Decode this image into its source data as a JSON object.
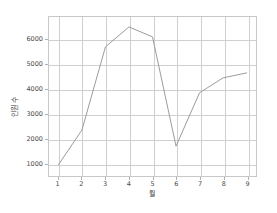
{
  "chart_data": {
    "type": "line",
    "title": "",
    "xlabel": "월",
    "ylabel": "인원 수",
    "x": [
      1,
      2,
      3,
      4,
      5,
      6,
      7,
      8,
      9
    ],
    "values": [
      950,
      2350,
      5700,
      6500,
      6100,
      1700,
      3850,
      4450,
      4650
    ],
    "series": [
      {
        "name": "",
        "values": [
          950,
          2350,
          5700,
          6500,
          6100,
          1700,
          3850,
          4450,
          4650
        ]
      }
    ],
    "xtick_labels": [
      "1",
      "2",
      "3",
      "4",
      "5",
      "6",
      "7",
      "8",
      "9"
    ],
    "ytick_labels": [
      "1000",
      "2000",
      "3000",
      "4000",
      "5000",
      "6000"
    ],
    "yticks": [
      1000,
      2000,
      3000,
      4000,
      5000,
      6000
    ],
    "xlim": [
      0.6,
      9.4
    ],
    "ylim": [
      500,
      6900
    ],
    "grid": true,
    "legend": false,
    "legend_position": "none",
    "line_color": "#9a9a9a",
    "grid_color": "#cfcfcf",
    "frame_color": "#c8c8c8",
    "background_color": "#ffffff",
    "text_color": "#4a4a4a"
  }
}
